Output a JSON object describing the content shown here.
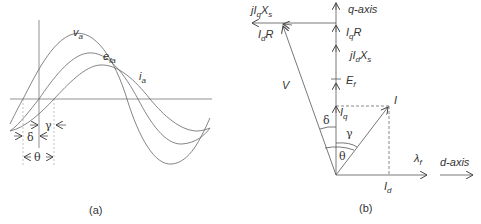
{
  "figure_a": {
    "caption": "(a)",
    "curves": [
      {
        "name": "v",
        "sub": "a",
        "label": "v_a"
      },
      {
        "name": "e",
        "sub": "fa",
        "label": "e_fa"
      },
      {
        "name": "i",
        "sub": "a",
        "label": "i_a"
      }
    ],
    "angles": {
      "delta": "δ",
      "gamma": "γ",
      "theta": "θ"
    }
  },
  "figure_b": {
    "caption": "(b)",
    "axes": {
      "q_axis": "q-axis",
      "d_axis": "d-axis"
    },
    "vectors": {
      "jIqXs": {
        "pre": "jI",
        "sub": "q",
        "post": "X",
        "sub2": "s"
      },
      "IdR": {
        "pre": "I",
        "sub": "d",
        "post": "R"
      },
      "IqR": {
        "pre": "I",
        "sub": "q",
        "post": "R"
      },
      "jIdXs": {
        "pre": "jI",
        "sub": "d",
        "post": "X",
        "sub2": "s"
      },
      "Ef": {
        "pre": "E",
        "sub": "f"
      },
      "V": "V",
      "I": "I",
      "Iq": {
        "pre": "I",
        "sub": "q"
      },
      "Id": {
        "pre": "I",
        "sub": "d"
      },
      "lambda_f": {
        "pre": "λ",
        "sub": "f"
      }
    },
    "angles": {
      "delta": "δ",
      "gamma": "γ",
      "theta": "θ"
    }
  }
}
